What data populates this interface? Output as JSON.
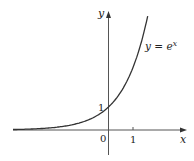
{
  "chart_data": {
    "type": "line",
    "title": "",
    "xlabel": "x",
    "ylabel": "y",
    "series": [
      {
        "name": "y = e^x",
        "function": "exp(x)",
        "x": [
          -4,
          -3,
          -2,
          -1,
          0,
          1,
          1.6
        ],
        "values": [
          0.018,
          0.05,
          0.135,
          0.368,
          1,
          2.718,
          4.95
        ]
      }
    ],
    "annotations": [
      {
        "text_main": "y = e",
        "text_sup": "x",
        "position": "right of curve upper"
      }
    ],
    "x_ticks": [
      {
        "value": 0,
        "label": "0"
      },
      {
        "value": 1,
        "label": "1"
      }
    ],
    "y_ticks": [
      {
        "value": 1,
        "label": "1"
      }
    ],
    "xlim": [
      -4,
      3.2
    ],
    "ylim": [
      -1.1,
      5
    ],
    "grid": false,
    "legend": "none"
  }
}
